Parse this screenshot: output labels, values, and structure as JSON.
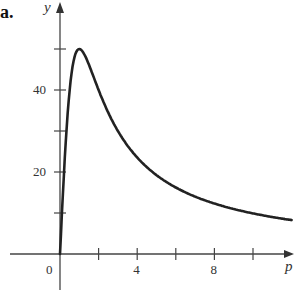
{
  "panel_label": "a.",
  "chart_data": {
    "type": "line",
    "title": "",
    "xlabel": "p",
    "ylabel": "y",
    "xlim": [
      -2.2,
      12.3
    ],
    "ylim": [
      -3,
      57
    ],
    "x_ticks": [
      2,
      4,
      6,
      8,
      10
    ],
    "x_tick_labels": {
      "0": "0",
      "4": "4",
      "8": "8"
    },
    "y_ticks": [
      10,
      20,
      30,
      40,
      50
    ],
    "y_tick_labels": {
      "20": "20",
      "40": "40"
    },
    "grid": false,
    "legend": null,
    "series": [
      {
        "name": "y(p)",
        "x": [
          0,
          0.25,
          0.5,
          0.75,
          1,
          1.5,
          2,
          3,
          4,
          5,
          6,
          7,
          8,
          9,
          10,
          11,
          12
        ],
        "y": [
          0,
          23.5,
          40,
          48,
          50,
          46,
          40,
          30,
          23.5,
          19.2,
          16.2,
          14,
          12.3,
          11,
          9.9,
          9,
          8.3
        ]
      }
    ]
  }
}
